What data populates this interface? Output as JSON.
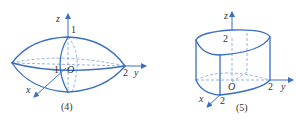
{
  "figures": [
    {
      "caption": "(4)",
      "axes": {
        "x": "x",
        "y": "y",
        "z": "z",
        "origin": "O"
      },
      "ticks": {
        "z": "1",
        "x": "1",
        "y": "2"
      },
      "shape": "ellipsoid-like solid with pointed ends along y-axis"
    },
    {
      "caption": "(5)",
      "axes": {
        "x": "x",
        "y": "y",
        "z": "z",
        "origin": "O"
      },
      "ticks": {
        "z": "2",
        "x": "2",
        "y": "2"
      },
      "shape": "cylinder-like solid over quarter-disk base with curved top"
    }
  ],
  "colors": {
    "stroke": "#3a6fc4",
    "dashed": "#7d9fd8",
    "text": "#333333"
  }
}
